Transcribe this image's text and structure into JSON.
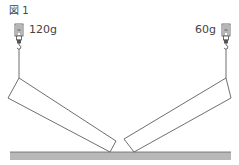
{
  "figure": {
    "label": "図 1",
    "left_scale": {
      "reading": "120g"
    },
    "right_scale": {
      "reading": "60g"
    }
  },
  "colors": {
    "stroke": "#4a4a4a",
    "ground_fill": "#b8b8b8",
    "ground_edge": "#666666"
  }
}
